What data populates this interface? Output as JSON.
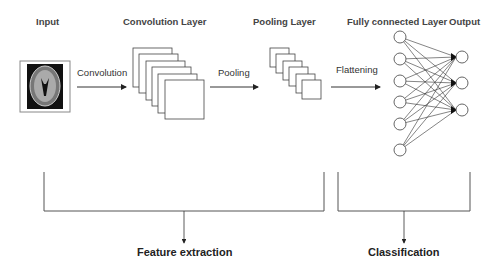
{
  "headers": {
    "input": "Input",
    "conv": "Convolution Layer",
    "pool": "Pooling Layer",
    "fc": "Fully connected Layer",
    "output": "Output"
  },
  "arrows": {
    "convolution": "Convolution",
    "pooling": "Pooling",
    "flattening": "Flattening"
  },
  "groups": {
    "feature": "Feature extraction",
    "classification": "Classification"
  },
  "network": {
    "fc_nodes": 6,
    "output_nodes": 3,
    "conv_maps": 6,
    "pool_maps": 6
  },
  "colors": {
    "line": "#333333",
    "brain_bg": "#111111"
  }
}
